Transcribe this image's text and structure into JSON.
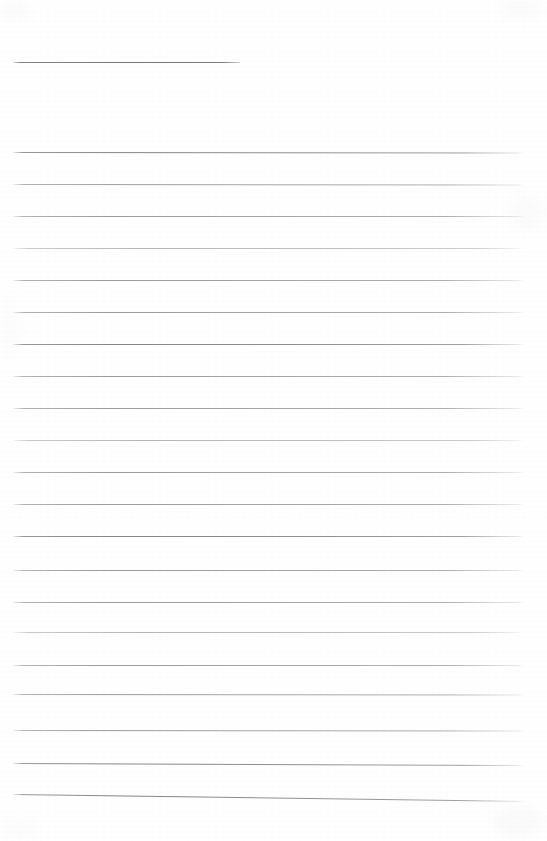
{
  "document": {
    "kind": "scanned-blank-ruled-paper",
    "page_width": 547,
    "page_height": 841,
    "background_color": "#ffffff",
    "visible_text": "",
    "note": "Blank scanned sheet of ruled notebook paper. No text, headings, numbers, labels or icons are rendered in the pixels."
  },
  "rules": {
    "heading_count": 1,
    "body_count": 21,
    "total_count": 22,
    "left_margin_px": 13,
    "right_edge_px": 523,
    "heading_right_edge_px": 240,
    "line_spacing_px": 32,
    "ink_color": "#9a9a9a",
    "heading_ink_color": "#787878",
    "items": [
      {
        "id": "rule-heading",
        "role": "heading-rule",
        "x": 13,
        "y": 62.0,
        "width": 227,
        "skew_px": 0.0,
        "weight": "heading"
      },
      {
        "id": "rule-01",
        "role": "body-rule",
        "x": 13,
        "y": 152.0,
        "width": 510,
        "skew_px": 0.5,
        "weight": "dark"
      },
      {
        "id": "rule-02",
        "role": "body-rule",
        "x": 13,
        "y": 184.0,
        "width": 510,
        "skew_px": 0.5,
        "weight": "normal"
      },
      {
        "id": "rule-03",
        "role": "body-rule",
        "x": 13,
        "y": 216.0,
        "width": 510,
        "skew_px": 0.0,
        "weight": "normal"
      },
      {
        "id": "rule-04",
        "role": "body-rule",
        "x": 13,
        "y": 248.0,
        "width": 510,
        "skew_px": 0.0,
        "weight": "light"
      },
      {
        "id": "rule-05",
        "role": "body-rule",
        "x": 13,
        "y": 280.0,
        "width": 510,
        "skew_px": 0.0,
        "weight": "normal"
      },
      {
        "id": "rule-06",
        "role": "body-rule",
        "x": 13,
        "y": 312.0,
        "width": 510,
        "skew_px": 0.0,
        "weight": "normal"
      },
      {
        "id": "rule-07",
        "role": "body-rule",
        "x": 13,
        "y": 344.0,
        "width": 510,
        "skew_px": 0.0,
        "weight": "dark"
      },
      {
        "id": "rule-08",
        "role": "body-rule",
        "x": 13,
        "y": 376.0,
        "width": 510,
        "skew_px": 0.0,
        "weight": "normal"
      },
      {
        "id": "rule-09",
        "role": "body-rule",
        "x": 13,
        "y": 408.0,
        "width": 510,
        "skew_px": 0.0,
        "weight": "normal"
      },
      {
        "id": "rule-10",
        "role": "body-rule",
        "x": 13,
        "y": 440.0,
        "width": 510,
        "skew_px": 0.0,
        "weight": "light"
      },
      {
        "id": "rule-11",
        "role": "body-rule",
        "x": 13,
        "y": 472.0,
        "width": 510,
        "skew_px": 0.0,
        "weight": "normal"
      },
      {
        "id": "rule-12",
        "role": "body-rule",
        "x": 13,
        "y": 504.0,
        "width": 510,
        "skew_px": 0.0,
        "weight": "normal"
      },
      {
        "id": "rule-13",
        "role": "body-rule",
        "x": 13,
        "y": 536.0,
        "width": 510,
        "skew_px": 0.0,
        "weight": "dark"
      },
      {
        "id": "rule-14",
        "role": "body-rule",
        "x": 13,
        "y": 570.0,
        "width": 510,
        "skew_px": 0.0,
        "weight": "normal"
      },
      {
        "id": "rule-15",
        "role": "body-rule",
        "x": 13,
        "y": 602.0,
        "width": 510,
        "skew_px": 0.0,
        "weight": "normal"
      },
      {
        "id": "rule-16",
        "role": "body-rule",
        "x": 13,
        "y": 632.0,
        "width": 510,
        "skew_px": 0.0,
        "weight": "light"
      },
      {
        "id": "rule-17",
        "role": "body-rule",
        "x": 13,
        "y": 665.0,
        "width": 510,
        "skew_px": 0.0,
        "weight": "normal"
      },
      {
        "id": "rule-18",
        "role": "body-rule",
        "x": 13,
        "y": 694.0,
        "width": 510,
        "skew_px": 0.5,
        "weight": "normal"
      },
      {
        "id": "rule-19",
        "role": "body-rule",
        "x": 13,
        "y": 730.0,
        "width": 510,
        "skew_px": 0.5,
        "weight": "normal"
      },
      {
        "id": "rule-20",
        "role": "body-rule",
        "x": 13,
        "y": 763.0,
        "width": 510,
        "skew_px": 2.0,
        "weight": "dark"
      },
      {
        "id": "rule-21",
        "role": "body-rule",
        "x": 13,
        "y": 794.0,
        "width": 510,
        "skew_px": 7.0,
        "weight": "dark"
      }
    ]
  },
  "artifacts": {
    "items": [
      {
        "id": "smudge-top-left",
        "x": 2,
        "y": 4,
        "width": 26,
        "height": 14,
        "opacity": 0.16,
        "color": "#dcdcdc"
      },
      {
        "id": "smudge-top-right",
        "x": 498,
        "y": 2,
        "width": 44,
        "height": 16,
        "opacity": 0.14,
        "color": "#e0e0e0"
      },
      {
        "id": "smudge-mid-right",
        "x": 508,
        "y": 196,
        "width": 36,
        "height": 34,
        "opacity": 0.13,
        "color": "#e2e2e2"
      },
      {
        "id": "smudge-bottom-right",
        "x": 492,
        "y": 806,
        "width": 52,
        "height": 30,
        "opacity": 0.15,
        "color": "#e0e0e0"
      },
      {
        "id": "smudge-bottom-left",
        "x": 0,
        "y": 820,
        "width": 40,
        "height": 18,
        "opacity": 0.12,
        "color": "#e4e4e4"
      },
      {
        "id": "smudge-left-edge",
        "x": 0,
        "y": 300,
        "width": 18,
        "height": 60,
        "opacity": 0.1,
        "color": "#e6e6e6"
      }
    ]
  }
}
